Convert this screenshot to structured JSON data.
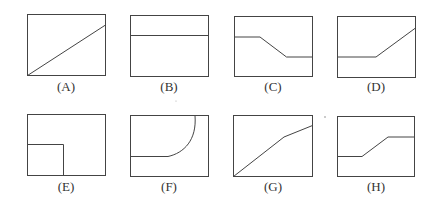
{
  "figure": {
    "stroke_color": "#444444",
    "panels": [
      {
        "label": "(A)",
        "shape": "diagonal line from bottom-left to upper-right"
      },
      {
        "label": "(B)",
        "shape": "horizontal line near top"
      },
      {
        "label": "(C)",
        "shape": "flat high, ramp down, flat low"
      },
      {
        "label": "(D)",
        "shape": "flat low, ramp up to right edge"
      },
      {
        "label": "(E)",
        "shape": "square in bottom-left corner"
      },
      {
        "label": "(F)",
        "shape": "flat line then curve up to top"
      },
      {
        "label": "(G)",
        "shape": "line rising from bottom-left, slope decreasing"
      },
      {
        "label": "(H)",
        "shape": "flat low, ramp up, flat high"
      }
    ]
  }
}
